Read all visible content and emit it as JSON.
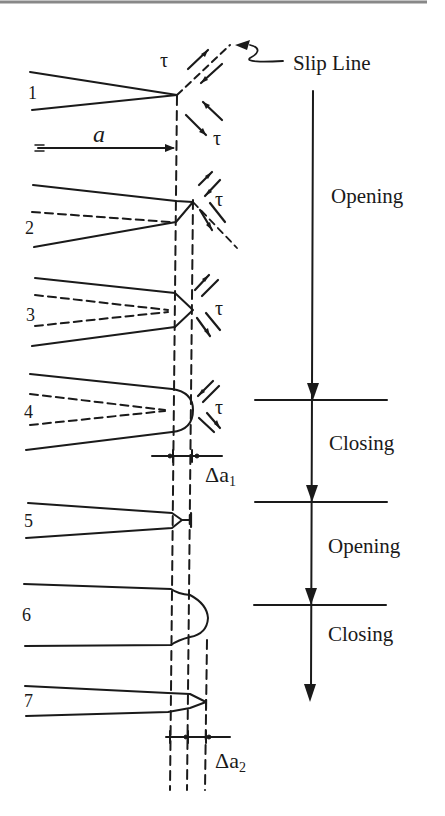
{
  "figure": {
    "top_rule_color": "#888888",
    "ink_color": "#1a1a1a",
    "slip_line_label": "Slip Line",
    "crack_length_label": "a",
    "shear_symbol": "τ",
    "stages": [
      {
        "number": "1",
        "description": "sharp crack with slip line ahead of tip"
      },
      {
        "number": "2",
        "description": "tip blunts, slip on one plane"
      },
      {
        "number": "3",
        "description": "slip on two planes"
      },
      {
        "number": "4",
        "description": "fully blunted rounded tip"
      },
      {
        "number": "5",
        "description": "re-sharpened crack advanced by Δa1"
      },
      {
        "number": "6",
        "description": "blunted again"
      },
      {
        "number": "7",
        "description": "re-sharpened crack advanced by Δa2"
      }
    ],
    "phases": [
      {
        "label": "Opening",
        "stages": "1-4"
      },
      {
        "label": "Closing",
        "stages": "4-5"
      },
      {
        "label": "Opening",
        "stages": "5-6"
      },
      {
        "label": "Closing",
        "stages": "6-7"
      }
    ],
    "increments": [
      {
        "symbol": "Δa",
        "subscript": "1"
      },
      {
        "symbol": "Δa",
        "subscript": "2"
      }
    ]
  }
}
